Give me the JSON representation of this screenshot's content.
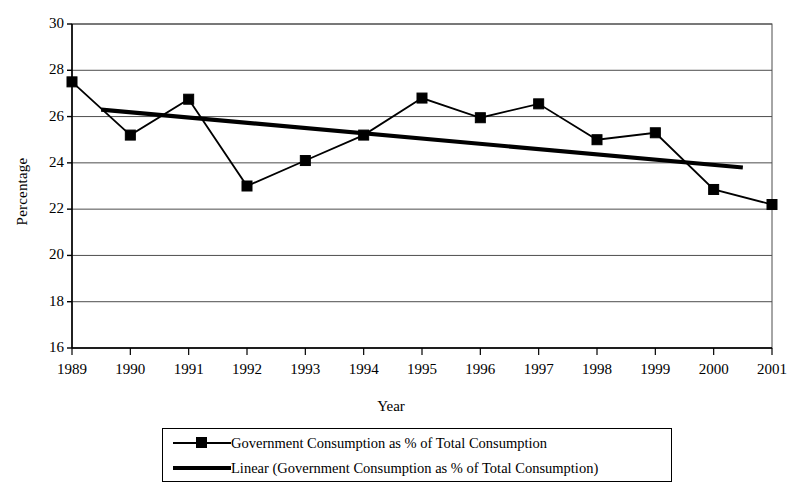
{
  "chart_data": {
    "type": "line",
    "title": "",
    "xlabel": "Year",
    "ylabel": "Percentage",
    "grid": true,
    "legend_position": "bottom",
    "xlim": [
      1989,
      2001
    ],
    "ylim": [
      16,
      30
    ],
    "y_ticks": [
      30,
      28,
      26,
      24,
      22,
      20,
      18,
      16
    ],
    "categories": [
      1989,
      1990,
      1991,
      1992,
      1993,
      1994,
      1995,
      1996,
      1997,
      1998,
      1999,
      2000,
      2001
    ],
    "x_tick_labels": [
      "1989",
      "1990",
      "1991",
      "1992",
      "1993",
      "1994",
      "1995",
      "1996",
      "1997",
      "1998",
      "1999",
      "2000",
      "2001"
    ],
    "series": [
      {
        "name": "Government Consumption as % of Total Consumption",
        "type": "line-markers",
        "marker": "square",
        "color": "#000000",
        "values": [
          27.5,
          25.2,
          26.75,
          23.0,
          24.1,
          25.2,
          26.8,
          25.95,
          26.55,
          25.0,
          25.3,
          22.85,
          22.2
        ]
      },
      {
        "name": "Linear (Government Consumption as % of Total Consumption)",
        "type": "trendline",
        "color": "#000000",
        "endpoints": [
          {
            "x": 1989.5,
            "y": 26.3
          },
          {
            "x": 2000.5,
            "y": 23.8
          }
        ]
      }
    ]
  },
  "legend": {
    "entries": [
      {
        "label": "Government Consumption as % of Total Consumption",
        "style": "line-marker"
      },
      {
        "label": "Linear (Government Consumption as % of Total Consumption)",
        "style": "thick-line"
      }
    ]
  },
  "axis_titles": {
    "y": "Percentage",
    "x": "Year"
  }
}
